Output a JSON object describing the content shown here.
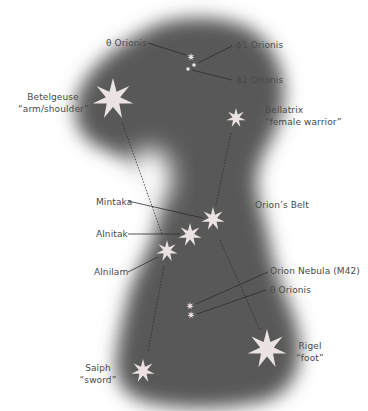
{
  "diagram": {
    "colors": {
      "background": "#ffffff",
      "sky": "#555555",
      "star": "#ebe2e2",
      "text": "#4a4a4a",
      "leader": "#2a2a2a",
      "dashed": "#2a2a2a"
    },
    "labels": {
      "theta_orionis_top": "θ Orionis",
      "phi1_orionis": "ϕ1 Orionis",
      "phi2_orionis": "ϕ2 Orionis",
      "betelgeuse": "Betelgeuse",
      "betelgeuse_sub": "“arm/shoulder”",
      "bellatrix": "Bellatrix",
      "bellatrix_sub": "“female warrior”",
      "mintaka": "Mintaka",
      "orions_belt": "Orion’s Belt",
      "alnitak": "Alnitak",
      "alnilam": "Alnilam",
      "orion_nebula": "Orion Nebula (M42)",
      "theta_orionis_bottom": "θ Orionis",
      "saiph": "Saiph",
      "saiph_sub": "“sword”",
      "rigel": "Rigel",
      "rigel_sub": "“foot”"
    },
    "stars": [
      {
        "name": "Betelgeuse",
        "icon": "star-7-point-icon",
        "x": 113,
        "y": 99,
        "r": 21
      },
      {
        "name": "Bellatrix",
        "icon": "star-7-point-icon",
        "x": 236,
        "y": 118,
        "r": 10
      },
      {
        "name": "Mintaka",
        "icon": "star-7-point-icon",
        "x": 213,
        "y": 219,
        "r": 12
      },
      {
        "name": "Alnitak",
        "icon": "star-7-point-icon",
        "x": 190,
        "y": 235,
        "r": 12
      },
      {
        "name": "Alnilam",
        "icon": "star-7-point-icon",
        "x": 167,
        "y": 251,
        "r": 11
      },
      {
        "name": "Rigel",
        "icon": "star-7-point-icon",
        "x": 267,
        "y": 349,
        "r": 20
      },
      {
        "name": "Saiph",
        "icon": "star-7-point-icon",
        "x": 143,
        "y": 371,
        "r": 12
      },
      {
        "name": "θ Orionis (head)",
        "icon": "small-star-icon",
        "x": 191,
        "y": 57,
        "r": 4
      },
      {
        "name": "ϕ1 Orionis",
        "icon": "dot-star-icon",
        "x": 194,
        "y": 65,
        "r": 2
      },
      {
        "name": "ϕ2 Orionis",
        "icon": "dot-star-icon",
        "x": 188,
        "y": 69,
        "r": 2
      },
      {
        "name": "Orion Nebula (M42)",
        "icon": "small-star-icon",
        "x": 190,
        "y": 306,
        "r": 4
      },
      {
        "name": "θ Orionis (sword)",
        "icon": "small-star-icon",
        "x": 191,
        "y": 315,
        "r": 4
      }
    ]
  }
}
